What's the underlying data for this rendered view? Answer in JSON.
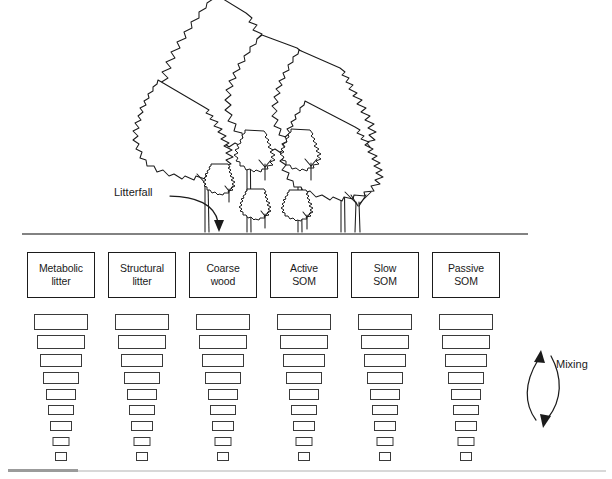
{
  "figure": {
    "background_color": "#ffffff",
    "line_color": "#1b1b1b",
    "rule_color": "#585858"
  },
  "labels": {
    "litterfall": "Litterfall",
    "mixing": "Mixing"
  },
  "icons": {
    "litterfall_arrow": "curved-down-arrow-icon",
    "mixing_arrow": "double-headed-curved-arrow-icon",
    "canopy": "forest-canopy-icon",
    "soil_line": "soil-surface-line-icon"
  },
  "pools": [
    {
      "id": "metabolic-litter",
      "line1": "Metabolic",
      "line2": "litter",
      "center_x": 61
    },
    {
      "id": "structural-litter",
      "line1": "Structural",
      "line2": "litter",
      "center_x": 142
    },
    {
      "id": "coarse-wood",
      "line1": "Coarse",
      "line2": "wood",
      "center_x": 223
    },
    {
      "id": "active-som",
      "line1": "Active",
      "line2": "SOM",
      "center_x": 304
    },
    {
      "id": "slow-som",
      "line1": "Slow",
      "line2": "SOM",
      "center_x": 385
    },
    {
      "id": "passive-som",
      "line1": "Passive",
      "line2": "SOM",
      "center_x": 466
    }
  ],
  "soil_layers": [
    {
      "index": 1,
      "width": 54,
      "height": 16,
      "top": 62
    },
    {
      "index": 2,
      "width": 48,
      "height": 14,
      "top": 83
    },
    {
      "index": 3,
      "width": 42,
      "height": 13,
      "top": 102
    },
    {
      "index": 4,
      "width": 36,
      "height": 12,
      "top": 120
    },
    {
      "index": 5,
      "width": 30,
      "height": 11,
      "top": 137
    },
    {
      "index": 6,
      "width": 26,
      "height": 10,
      "top": 153
    },
    {
      "index": 7,
      "width": 22,
      "height": 10,
      "top": 169
    },
    {
      "index": 8,
      "width": 17,
      "height": 9,
      "top": 185
    },
    {
      "index": 9,
      "width": 12,
      "height": 9,
      "top": 200
    }
  ],
  "rules": {
    "soil_surface": {
      "x1": 22,
      "x2": 528,
      "y": 234
    },
    "bottom_dark": {
      "x": 8,
      "y": 469,
      "width": 70
    },
    "bottom_light": {
      "x": 78,
      "y": 470,
      "width": 528
    }
  }
}
